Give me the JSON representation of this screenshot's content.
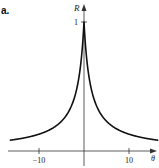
{
  "panel_label": "a.",
  "chart_data": {
    "type": "line",
    "title": "",
    "xlabel": "θ",
    "ylabel": "R",
    "function_description": "R(θ) symmetric cusp decaying from R=1 at θ=0",
    "xlim": [
      -16,
      16
    ],
    "ylim": [
      0,
      1.1
    ],
    "grid": false,
    "legend": null,
    "x_ticks": [
      -10,
      10
    ],
    "x_tick_labels": [
      "−10",
      "10"
    ],
    "y_ticks": [
      1
    ],
    "y_tick_labels": [
      "1"
    ],
    "series": [
      {
        "name": "R",
        "x": [
          -16,
          -14,
          -12,
          -10,
          -8,
          -6,
          -4,
          -3,
          -2,
          -1.5,
          -1,
          -0.5,
          -0.25,
          0,
          0.25,
          0.5,
          1,
          1.5,
          2,
          3,
          4,
          6,
          8,
          10,
          12,
          14,
          16
        ],
        "y": [
          0.086,
          0.097,
          0.111,
          0.13,
          0.158,
          0.2,
          0.273,
          0.333,
          0.429,
          0.5,
          0.6,
          0.75,
          0.857,
          1.0,
          0.857,
          0.75,
          0.6,
          0.5,
          0.429,
          0.333,
          0.273,
          0.2,
          0.158,
          0.13,
          0.111,
          0.097,
          0.086
        ]
      }
    ]
  }
}
